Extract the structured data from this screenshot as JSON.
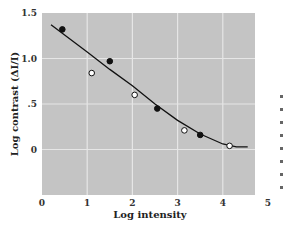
{
  "chart_data": {
    "type": "scatter",
    "title": "",
    "xlabel": "Log intensity",
    "ylabel": "Log contrast (ΔI/I)",
    "xlim": [
      0,
      5
    ],
    "ylim": [
      -0.5,
      1.5
    ],
    "x_ticks": [
      "0",
      "1",
      "2",
      "3",
      "4",
      "5"
    ],
    "y_ticks": [
      "1.5",
      "1.0",
      ".5",
      "0"
    ],
    "grid": true,
    "background": "#c4c4c4",
    "series": [
      {
        "name": "filled-circles",
        "marker": "filled",
        "points": [
          {
            "x": 0.45,
            "y": 1.32
          },
          {
            "x": 1.5,
            "y": 0.97
          },
          {
            "x": 2.55,
            "y": 0.45
          },
          {
            "x": 3.5,
            "y": 0.16
          }
        ]
      },
      {
        "name": "open-circles",
        "marker": "open",
        "points": [
          {
            "x": 1.1,
            "y": 0.84
          },
          {
            "x": 2.05,
            "y": 0.6
          },
          {
            "x": 3.15,
            "y": 0.21
          },
          {
            "x": 4.15,
            "y": 0.04
          }
        ]
      },
      {
        "name": "fit-curve",
        "marker": "line",
        "points": [
          {
            "x": 0.2,
            "y": 1.37
          },
          {
            "x": 1.0,
            "y": 1.07
          },
          {
            "x": 1.5,
            "y": 0.88
          },
          {
            "x": 2.0,
            "y": 0.7
          },
          {
            "x": 2.5,
            "y": 0.5
          },
          {
            "x": 3.0,
            "y": 0.32
          },
          {
            "x": 3.5,
            "y": 0.17
          },
          {
            "x": 4.0,
            "y": 0.06
          },
          {
            "x": 4.3,
            "y": 0.03
          },
          {
            "x": 4.55,
            "y": 0.03
          }
        ]
      }
    ]
  }
}
